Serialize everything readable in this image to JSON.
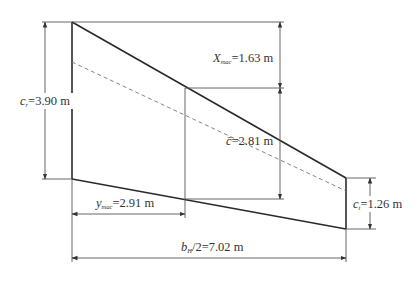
{
  "diagram": {
    "type": "trapezoidal wing planform (half-span) with mean aerodynamic chord",
    "labels": {
      "root_chord": {
        "symbol": "c",
        "subscript": "r",
        "equals": "=3.90 m"
      },
      "x_mac": {
        "symbol": "X",
        "subscript": "mac",
        "equals": "=1.63 m"
      },
      "mac_chord": {
        "symbol": "c̄",
        "equals": "=2.81 m"
      },
      "tip_chord": {
        "symbol": "c",
        "subscript": "t",
        "equals": "=1.26 m"
      },
      "y_mac": {
        "symbol": "y",
        "subscript": "mac",
        "equals": "=2.91 m"
      },
      "half_span": {
        "symbol": "b",
        "subscript": "H",
        "equals": "/2=7.02 m"
      }
    },
    "values": {
      "root_chord_m": 3.9,
      "tip_chord_m": 1.26,
      "mac_chord_m": 2.81,
      "x_mac_m": 1.63,
      "y_mac_m": 2.91,
      "half_span_m": 7.02
    },
    "colors": {
      "outline": "#2a2a2a",
      "dimension_lines": "#555555",
      "dashed_line": "#777777",
      "text": "#333333",
      "background": "#ffffff"
    }
  }
}
